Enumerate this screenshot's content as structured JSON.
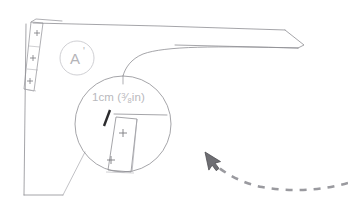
{
  "doc": {
    "title": "Sewing Pattern Piece Detail",
    "background_color": "#ffffff",
    "width": 348,
    "height": 216
  },
  "palette": {
    "outline": "#8e8e93",
    "outline_light": "#c3c3c8",
    "label_gray": "#b4b4b8",
    "measure_gray": "#b9b9bd",
    "tick_dark": "#2b2b2e",
    "cursor_fill": "#6e6e73",
    "cursor_stroke": "#4a4a4e",
    "trail_gray": "#9a9a9f"
  },
  "pattern": {
    "piece_label": "A",
    "piece_label_prime": "'",
    "piece_label_name": "piece-a-prime",
    "notch_marks": [
      "+",
      "+",
      "+"
    ],
    "notch_count": 3
  },
  "detail_callout": {
    "measure_text_prefix": "1cm (",
    "fraction_numerator": "3",
    "fraction_slash": "⁄",
    "fraction_denominator": "8",
    "measure_text_suffix": "in)",
    "full_text": "1cm (3/8in)",
    "magnified_notch_marks": [
      "+",
      "+"
    ],
    "magnified_notch_count": 2
  },
  "cursor": {
    "icon": "arrow-pointer-icon",
    "x": 210,
    "y": 160,
    "trail_style": "dashed",
    "trail_dash_count": 11
  }
}
